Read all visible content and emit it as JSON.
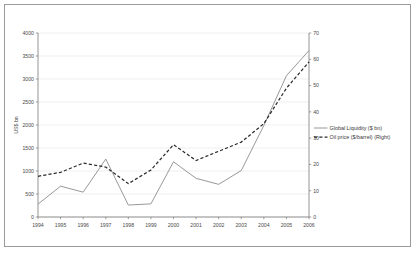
{
  "chart_data": {
    "type": "line",
    "title": "",
    "xlabel": "",
    "ylabel": "US$ bn",
    "y2label": "",
    "categories": [
      "1994",
      "1995",
      "1996",
      "1997",
      "1998",
      "1999",
      "2000",
      "2001",
      "2002",
      "2003",
      "2004",
      "2005",
      "2006"
    ],
    "ylim": [
      0,
      4000
    ],
    "y2lim": [
      0,
      70
    ],
    "yticks": [
      0,
      500,
      1000,
      1500,
      2000,
      2500,
      3000,
      3500,
      4000
    ],
    "y2ticks": [
      0,
      10,
      20,
      30,
      40,
      50,
      60,
      70
    ],
    "grid": true,
    "legend_position": "right",
    "series": [
      {
        "name": "Global Liquidity ($ bn)",
        "axis": "left",
        "style": "solid",
        "color": "#8c8c8c",
        "values": [
          280,
          670,
          540,
          1260,
          260,
          285,
          1200,
          840,
          710,
          1010,
          1990,
          3070,
          3620
        ]
      },
      {
        "name": "Oil price ($/barrel) (Right)",
        "axis": "right",
        "style": "dashed",
        "color": "#2b2b2b",
        "values": [
          15.5,
          17.0,
          20.5,
          19.0,
          12.7,
          17.9,
          27.5,
          21.5,
          25.0,
          28.5,
          35.5,
          49.0,
          59.0
        ]
      }
    ]
  },
  "legend": {
    "items": [
      {
        "label": "Global Liquidity ($ bn)"
      },
      {
        "label": "Oil price ($/barrel) (Right)"
      }
    ]
  },
  "axes": {
    "left_title": "US$ bn"
  }
}
